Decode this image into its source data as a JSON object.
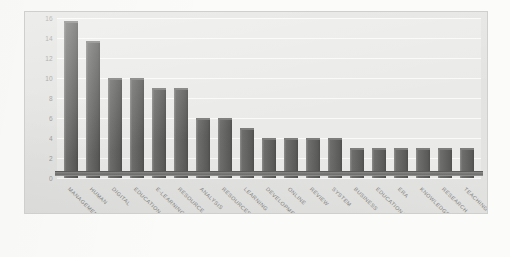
{
  "chart_data": {
    "type": "bar",
    "title": "",
    "subtitle": "",
    "xlabel": "",
    "ylabel": "",
    "ylim": [
      0,
      16
    ],
    "ytick_step": 2,
    "yticks": [
      16,
      14,
      12,
      10,
      8,
      6,
      4,
      2,
      0
    ],
    "grid": true,
    "legend": "none",
    "orientation": "vertical",
    "label_rotation": 45,
    "categories": [
      "MANAGEMENT",
      "HUMAN",
      "DIGITAL",
      "EDUCATION",
      "E-LEARNING",
      "RESOURCE",
      "ANALYSIS",
      "RESOURCES",
      "LEARNING",
      "DEVELOPMENT",
      "ONLINE",
      "REVIEW",
      "SYSTEM",
      "BUSINESS",
      "EDUCATIONAL",
      "ERA",
      "KNOWLEDGE",
      "RESEARCH",
      "TEACHING"
    ],
    "values": [
      15.7,
      13.7,
      10,
      10,
      9,
      9,
      6,
      6,
      5,
      4,
      4,
      4,
      4,
      3,
      3,
      3,
      3,
      3,
      3
    ],
    "series": [
      {
        "name": "frequency",
        "values": [
          15.7,
          13.7,
          10,
          10,
          9,
          9,
          6,
          6,
          5,
          4,
          4,
          4,
          4,
          3,
          3,
          3,
          3,
          3,
          3
        ]
      }
    ]
  },
  "style": {
    "bar_color": "#636361",
    "bar_edge_color": "#4e4e4c",
    "panel_background": "#e3e3e1",
    "plot_background": "#eaeae8",
    "page_background": "#fbfbfa",
    "grid_color": "#ffffff",
    "tick_label_color": "#8d8d8a",
    "category_label_color": "#7c7c79",
    "axis_line_color": "#5d5d5b"
  }
}
